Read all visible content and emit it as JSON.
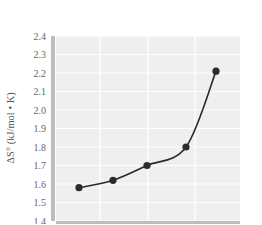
{
  "chart_data": {
    "type": "line",
    "title": "",
    "xlabel": "",
    "ylabel": "ΔS° (kJ/mol • K)",
    "ylim": [
      1.4,
      2.4
    ],
    "yticks": [
      "2.4",
      "2.3",
      "2.2",
      "2.1",
      "2.0",
      "1.9",
      "1.8",
      "1.7",
      "1.6",
      "1.5",
      "1.4"
    ],
    "grid": true,
    "legend": null,
    "series": [
      {
        "name": "ΔS°",
        "x": [
          1,
          2,
          3,
          4,
          5
        ],
        "values": [
          1.58,
          1.62,
          1.7,
          1.8,
          2.21
        ]
      }
    ]
  },
  "style": {
    "plot_bg": "#efefef",
    "grid_color": "#ffffff",
    "axis_strip_color": "#bdbdbd",
    "line_color": "#2b2b2b",
    "marker_color": "#2b2b2b"
  }
}
